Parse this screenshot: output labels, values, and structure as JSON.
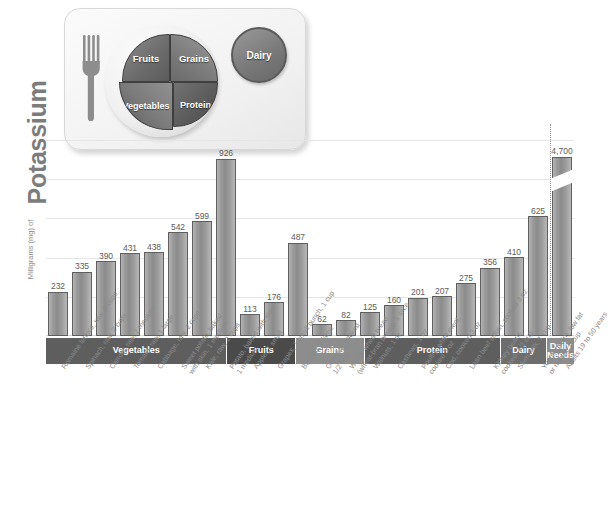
{
  "myplate": {
    "fork_icon": "fork-icon",
    "segments": [
      {
        "key": "fruits",
        "label": "Fruits"
      },
      {
        "key": "grains",
        "label": "Grains"
      },
      {
        "key": "vegetables",
        "label": "Vegetables"
      },
      {
        "key": "protein",
        "label": "Protein"
      }
    ],
    "dairy_label": "Dairy"
  },
  "axis": {
    "title_main": "Potassium",
    "title_small": "Milligrams (mg) of"
  },
  "colors": {
    "bar_fill": "#9e9e9e",
    "bar_outline": "#5f5f5f",
    "band_vegetables": "#5e5e5e",
    "band_fruits": "#4a4a4a",
    "band_grains": "#8d8d8d",
    "band_protein": "#5e5e5e",
    "band_dairy": "#6d6d6d",
    "band_daily_needs": "#8d8d8d",
    "gridline": "#e6e6e6",
    "text": "#8a8a8a"
  },
  "categories": [
    {
      "name": "Vegetables",
      "span": 8,
      "style": "dark"
    },
    {
      "name": "Fruits",
      "span": 3,
      "style": "darker"
    },
    {
      "name": "Grains",
      "span": 3,
      "style": "light"
    },
    {
      "name": "Protein",
      "span": 6,
      "style": "dark"
    },
    {
      "name": "Dairy",
      "span": 2,
      "style": "mid"
    },
    {
      "name": "Daily\nNeeds",
      "span": 1,
      "style": "light"
    }
  ],
  "chart_data": {
    "type": "bar",
    "title": "Potassium",
    "xlabel": "",
    "ylabel": "Milligrams (mg) of Potassium",
    "ylim": [
      0,
      950
    ],
    "grid": true,
    "legend": "none",
    "note": "Final bar is drawn with an axis break; its true value 4,700 exceeds the plotted scale.",
    "categories": [
      "Romaine lettuce, raw, 2 cups",
      "Spinach, raw, 2 cups",
      "Carrots, raw, 2 medium",
      "Tomato, raw, 1 large",
      "Cabbage, raw, 2 cups",
      "Sweet potato, baked\nwith skin, 1 medium",
      "Kale, raw, 2 cups",
      "Potato, baked with skin,\n1 medium",
      "Apple, 1 small",
      "Grapes, 1 small bunch, 1 cup",
      "Banana, 1 large",
      "Oatmeal, cooked,\n1/2 cup",
      "Whole-wheat bread\n(wheat-bran bread), 1 slice",
      "Walnuts, 1 oz",
      "Cashews, 1 oz",
      "Poultry, white meat,\ncooked 3 oz",
      "Cod, cooked 3 oz",
      "Lean beef sirloin, cooked 3 oz",
      "Kidney beans,\ncooked, 1/2 cup",
      "Skim milk, 1 cup",
      "Yogurt (plain), low fat\nor nonfat, 1 cup",
      "Adults 19 to 50 years"
    ],
    "values": [
      232,
      335,
      390,
      431,
      438,
      542,
      599,
      926,
      113,
      176,
      487,
      62,
      82,
      125,
      160,
      201,
      207,
      275,
      356,
      410,
      625,
      4700
    ],
    "value_labels": [
      "232",
      "335",
      "390",
      "431",
      "438",
      "542",
      "599",
      "926",
      "113",
      "176",
      "487",
      "62",
      "82",
      "125",
      "160",
      "201",
      "207",
      "275",
      "356",
      "410",
      "625",
      "4,700"
    ],
    "group_of": [
      "Vegetables",
      "Vegetables",
      "Vegetables",
      "Vegetables",
      "Vegetables",
      "Vegetables",
      "Vegetables",
      "Vegetables",
      "Fruits",
      "Fruits",
      "Fruits",
      "Grains",
      "Grains",
      "Grains",
      "Protein",
      "Protein",
      "Protein",
      "Protein",
      "Protein",
      "Dairy",
      "Dairy",
      "Daily Needs"
    ]
  }
}
